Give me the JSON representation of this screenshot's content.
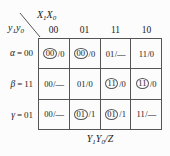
{
  "figure": {
    "column_variable": "X₁X₀",
    "column_variable_base": "X",
    "row_variable": "y₁y₀",
    "caption": "Y₁Y₀/Z",
    "column_headers": [
      "00",
      "01",
      "11",
      "10"
    ],
    "row_headers": [
      {
        "state": "α",
        "eq": "=",
        "code": "00",
        "label": "α = 00"
      },
      {
        "state": "β",
        "eq": "=",
        "code": "11",
        "label": "β = 11"
      },
      {
        "state": "γ",
        "eq": "=",
        "code": "01",
        "label": "γ = 01"
      }
    ],
    "cells": [
      [
        {
          "next": "00",
          "sep": "/",
          "out": "0",
          "stable": true,
          "text": "00/0"
        },
        {
          "next": "00",
          "sep": "/",
          "out": "0",
          "stable": true,
          "text": "00/0"
        },
        {
          "next": "01",
          "sep": "/",
          "out": "—",
          "stable": false,
          "text": "01/—"
        },
        {
          "next": "11",
          "sep": "/",
          "out": "0",
          "stable": false,
          "text": "11/0"
        }
      ],
      [
        {
          "next": "00",
          "sep": "/",
          "out": "—",
          "stable": false,
          "text": "00/—"
        },
        {
          "next": "01",
          "sep": "/",
          "out": "0",
          "stable": false,
          "text": "01/0"
        },
        {
          "next": "11",
          "sep": "/",
          "out": "0",
          "stable": true,
          "text": "11/0"
        },
        {
          "next": "11",
          "sep": "/",
          "out": "0",
          "stable": true,
          "text": "11/0"
        }
      ],
      [
        {
          "next": "00",
          "sep": "/",
          "out": "—",
          "stable": false,
          "text": "00/—"
        },
        {
          "next": "01",
          "sep": "/",
          "out": "1",
          "stable": true,
          "text": "01/1"
        },
        {
          "next": "01",
          "sep": "/",
          "out": "1",
          "stable": true,
          "text": "01/1"
        },
        {
          "next": "11",
          "sep": "/",
          "out": "—",
          "stable": false,
          "text": "11/—"
        }
      ]
    ],
    "colors": {
      "background": "#fcfcfc",
      "line": "#555555",
      "text": "#1a1a1a"
    }
  }
}
